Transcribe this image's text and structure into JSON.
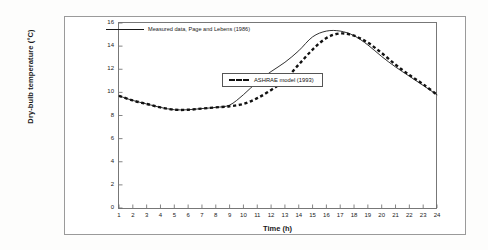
{
  "chart_data": {
    "type": "line",
    "title": "",
    "xlabel": "Time (h)",
    "ylabel": "Dry-bulb temperature (°C)",
    "xlim": [
      1,
      24
    ],
    "ylim": [
      0,
      16
    ],
    "xticks": [
      1,
      2,
      3,
      4,
      5,
      6,
      7,
      8,
      9,
      10,
      11,
      12,
      13,
      14,
      15,
      16,
      17,
      18,
      19,
      20,
      21,
      22,
      23,
      24
    ],
    "yticks": [
      0,
      2,
      4,
      6,
      8,
      10,
      12,
      14,
      16
    ],
    "grid": false,
    "legend_position": "inside",
    "x": [
      1,
      2,
      3,
      4,
      5,
      6,
      7,
      8,
      9,
      10,
      11,
      12,
      13,
      14,
      15,
      16,
      17,
      18,
      19,
      20,
      21,
      22,
      23,
      24
    ],
    "series": [
      {
        "name": "Measured data, Page and Lebens (1986)",
        "style": "solid",
        "color": "#1a1a1a",
        "values": [
          9.7,
          9.3,
          9.0,
          8.7,
          8.5,
          8.5,
          8.6,
          8.7,
          8.9,
          9.8,
          10.9,
          11.8,
          12.6,
          13.6,
          14.8,
          15.3,
          15.3,
          14.9,
          14.1,
          13.1,
          12.2,
          11.4,
          10.6,
          9.8
        ]
      },
      {
        "name": "ASHRAE model (1993)",
        "style": "dashed",
        "color": "#111111",
        "values": [
          9.7,
          9.3,
          9.0,
          8.7,
          8.5,
          8.5,
          8.6,
          8.7,
          8.8,
          9.0,
          9.5,
          10.2,
          11.1,
          12.4,
          13.7,
          14.7,
          15.1,
          14.9,
          14.3,
          13.4,
          12.4,
          11.5,
          10.7,
          9.8
        ]
      }
    ]
  },
  "legend": {
    "measured_label": "Measured data, Page and Lebens (1986)",
    "ashrae_label": "ASHRAE model (1993)"
  },
  "axes": {
    "x_title": "Time (h)",
    "y_title": "Dry-bulb temperature (°C)"
  }
}
